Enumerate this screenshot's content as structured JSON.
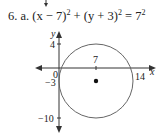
{
  "problem": {
    "number": "6.",
    "part": "a.",
    "equation": {
      "h_term": "(x − 7)",
      "k_term": "(y + 3)",
      "r_term": "7",
      "exp": "2",
      "plus": "+",
      "equals": "="
    }
  },
  "graph": {
    "x_axis_label": "x",
    "y_axis_label": "y",
    "tick_labels": {
      "y_top": "4",
      "origin": "0",
      "y_center": "−3",
      "y_bottom": "−10",
      "x_center": "7",
      "x_right": "14"
    },
    "circle": {
      "center": [
        7,
        -3
      ],
      "radius": 7
    },
    "colors": {
      "circle": "#666666",
      "axes": "#333333",
      "center_dot": "#111111"
    }
  }
}
